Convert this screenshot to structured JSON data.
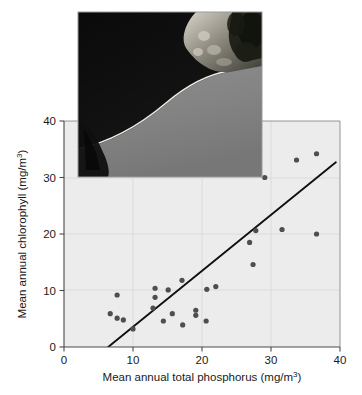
{
  "chart_data": {
    "type": "scatter",
    "title": "",
    "xlabel": "Mean annual total phosphorus (mg/m",
    "xlabel_sup": "3",
    "xlabel_tail": ")",
    "ylabel": "Mean annual chlorophyll (mg/m",
    "ylabel_sup": "3",
    "ylabel_tail": ")",
    "xlim": [
      0,
      40
    ],
    "ylim": [
      0,
      40
    ],
    "xticks": [
      0,
      10,
      20,
      30,
      40
    ],
    "yticks": [
      0,
      10,
      20,
      30,
      40
    ],
    "xticklabels": [
      "0",
      "10",
      "20",
      "30",
      "40"
    ],
    "yticklabels": [
      "0",
      "10",
      "20",
      "30",
      "40"
    ],
    "grid": true,
    "legend": "none",
    "marker": "filled-circle",
    "marker_color": "#4e4e4e",
    "plot_bg_color": "#ececec",
    "trendline": {
      "type": "linear-regression",
      "color": "#111111",
      "x_start": 6.4,
      "y_start": 0.0,
      "x_end": 39.4,
      "y_end": 32.7
    },
    "points": [
      {
        "x": 7.7,
        "y": 9.2
      },
      {
        "x": 6.7,
        "y": 5.9
      },
      {
        "x": 7.7,
        "y": 5.1
      },
      {
        "x": 8.6,
        "y": 4.8
      },
      {
        "x": 10.0,
        "y": 3.2
      },
      {
        "x": 13.2,
        "y": 10.4
      },
      {
        "x": 15.1,
        "y": 10.1
      },
      {
        "x": 13.2,
        "y": 8.8
      },
      {
        "x": 12.9,
        "y": 6.9
      },
      {
        "x": 17.1,
        "y": 11.8
      },
      {
        "x": 15.7,
        "y": 5.9
      },
      {
        "x": 14.4,
        "y": 4.6
      },
      {
        "x": 19.1,
        "y": 6.5
      },
      {
        "x": 17.2,
        "y": 3.9
      },
      {
        "x": 20.7,
        "y": 10.2
      },
      {
        "x": 19.1,
        "y": 5.6
      },
      {
        "x": 20.6,
        "y": 4.6
      },
      {
        "x": 22.0,
        "y": 10.7
      },
      {
        "x": 26.9,
        "y": 18.5
      },
      {
        "x": 27.4,
        "y": 14.6
      },
      {
        "x": 27.8,
        "y": 20.6
      },
      {
        "x": 29.1,
        "y": 30.0
      },
      {
        "x": 31.6,
        "y": 20.8
      },
      {
        "x": 33.7,
        "y": 33.1
      },
      {
        "x": 36.6,
        "y": 34.2
      },
      {
        "x": 36.6,
        "y": 20.0
      }
    ]
  },
  "inset": {
    "name": "aerial-shoreline-photograph",
    "description": "Aerial photograph of a lake shoreline with dark forested land and light water",
    "bounds": {
      "x": 78,
      "y": 12,
      "width": 184,
      "height": 165
    }
  }
}
